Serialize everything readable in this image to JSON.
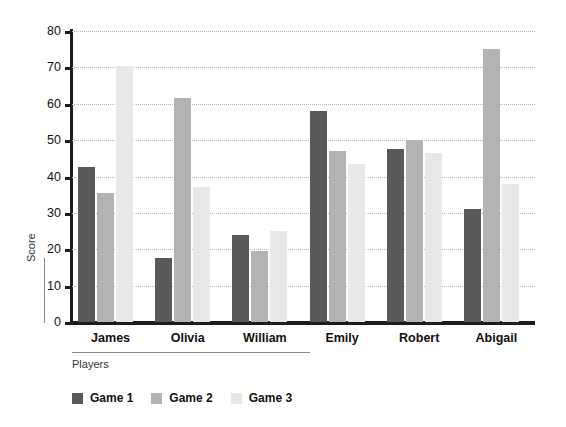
{
  "chart_data": {
    "type": "bar",
    "title": "",
    "xlabel": "Players",
    "ylabel": "Score",
    "ylim": [
      0,
      80
    ],
    "ytick_step": 10,
    "yticks": [
      0,
      10,
      20,
      30,
      40,
      50,
      60,
      70,
      80
    ],
    "grid": true,
    "legend_position": "bottom-left",
    "categories": [
      "James",
      "Olivia",
      "William",
      "Emily",
      "Robert",
      "Abigail"
    ],
    "series": [
      {
        "name": "Game 1",
        "color": "#595959",
        "values": [
          42.5,
          17.5,
          24.0,
          58.0,
          47.5,
          31.0
        ]
      },
      {
        "name": "Game 2",
        "color": "#b3b3b3",
        "values": [
          35.5,
          61.5,
          19.5,
          47.0,
          50.0,
          75.0
        ]
      },
      {
        "name": "Game 3",
        "color": "#e8e8e8",
        "values": [
          70.5,
          37.0,
          25.0,
          43.5,
          46.5,
          38.0
        ]
      }
    ]
  },
  "axis": {
    "y_title": "Score",
    "x_title": "Players"
  },
  "colors": {
    "axis": "#1c1c1c",
    "grid": "#b9b9b9",
    "background": "#ffffff"
  }
}
